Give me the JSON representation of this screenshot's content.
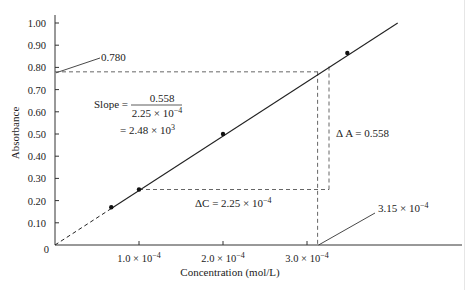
{
  "chart_data": {
    "type": "line",
    "title": "",
    "xlabel": "Concentration (mol/L)",
    "ylabel": "Absorbance",
    "xlim": [
      0,
      0.00045
    ],
    "ylim": [
      0,
      1.0
    ],
    "grid": false,
    "x_ticks": [
      "1.0 × 10⁻⁴",
      "2.0 × 10⁻⁴",
      "3.0 × 10⁻⁴"
    ],
    "x_tick_values": [
      0.0001,
      0.0002,
      0.0003
    ],
    "y_ticks": [
      "0",
      "0.10",
      "0.20",
      "0.30",
      "0.40",
      "0.50",
      "0.60",
      "0.70",
      "0.80",
      "0.90",
      "1.00"
    ],
    "y_tick_values": [
      0,
      0.1,
      0.2,
      0.3,
      0.4,
      0.5,
      0.6,
      0.7,
      0.8,
      0.9,
      1.0
    ],
    "series": [
      {
        "name": "Calibration data",
        "x": [
          6.7e-05,
          0.0001,
          0.0002,
          0.000348
        ],
        "y": [
          0.17,
          0.25,
          0.5,
          0.865
        ]
      }
    ],
    "fit_line": {
      "x_start": 0,
      "y_start": 0,
      "x_end": 0.000408,
      "y_end": 1.0,
      "dashed_segment_to_x": 6.7e-05
    },
    "annotations": {
      "y_read": "0.780",
      "x_read": "3.15 × 10⁻⁴",
      "slope_label": "Slope =",
      "slope_numerator": "0.558",
      "slope_denominator": "2.25 × 10⁻⁴",
      "slope_result": "= 2.48 × 10³",
      "delta_c": "ΔC = 2.25 × 10⁻⁴",
      "delta_a": "Δ A = 0.558"
    }
  }
}
